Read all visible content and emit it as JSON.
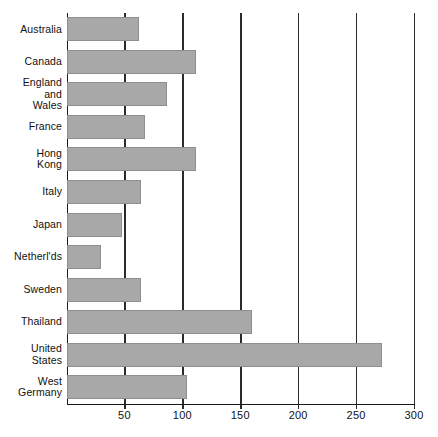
{
  "chart_data": {
    "type": "bar",
    "orientation": "horizontal",
    "title": "",
    "subtitle": "",
    "xlabel": "",
    "ylabel": "",
    "xlim": [
      0,
      300
    ],
    "ylim": null,
    "grid": true,
    "legend": null,
    "x_ticks": [
      50,
      100,
      150,
      200,
      250,
      300
    ],
    "x_tick_labels": [
      "50",
      "100",
      "150",
      "200",
      "250",
      "300"
    ],
    "categories": [
      "Australia",
      "Canada",
      "England\nand\nWales",
      "France",
      "Hong\nKong",
      "Italy",
      "Japan",
      "Netherl'ds",
      "Sweden",
      "Thailand",
      "United\nStates",
      "West\nGermany"
    ],
    "values": [
      63,
      112,
      87,
      68,
      112,
      64,
      48,
      30,
      64,
      160,
      272,
      104
    ],
    "bar_color": "#a8a8a8",
    "axis_color": "#1a1a1a",
    "background_color": "#ffffff",
    "annotations": []
  },
  "axis": {
    "tick_0": "50",
    "tick_1": "100",
    "tick_2": "150",
    "tick_3": "200",
    "tick_4": "250",
    "tick_5": "300"
  },
  "labels": {
    "l0": "Australia",
    "l1": "Canada",
    "l2": "England\nand\nWales",
    "l3": "France",
    "l4": "Hong\nKong",
    "l5": "Italy",
    "l6": "Japan",
    "l7": "Netherl'ds",
    "l8": "Sweden",
    "l9": "Thailand",
    "l10": "United\nStates",
    "l11": "West\nGermany"
  }
}
